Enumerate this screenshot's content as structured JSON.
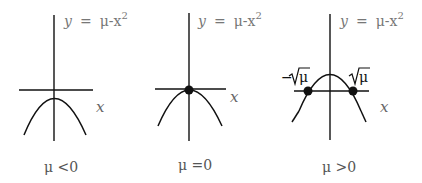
{
  "figure": {
    "panels": [
      {
        "equation": {
          "y": "y",
          "eq": "=",
          "rhs": "μ-x",
          "exp": "2"
        },
        "x_axis_label": "x",
        "caption": "μ <0",
        "fixed_points": []
      },
      {
        "equation": {
          "y": "y",
          "eq": "=",
          "rhs": "μ-x",
          "exp": "2"
        },
        "x_axis_label": "x",
        "caption": "μ =0",
        "fixed_points": [
          "0"
        ]
      },
      {
        "equation": {
          "y": "y",
          "eq": "=",
          "rhs": "μ-x",
          "exp": "2"
        },
        "x_axis_label": "x",
        "caption": "μ >0",
        "fixed_points": [
          "−√μ",
          "√μ"
        ],
        "root_labels": {
          "left": "−",
          "mu": "μ",
          "right_mu": "μ"
        }
      }
    ]
  }
}
